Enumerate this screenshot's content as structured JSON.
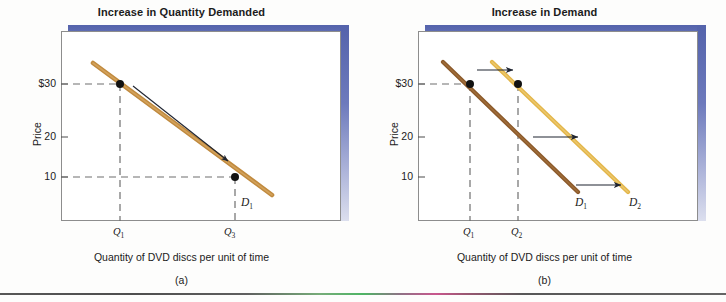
{
  "figure": {
    "panels": [
      {
        "id": "a",
        "title": "Increase in Quantity Demanded",
        "letter": "(a)",
        "x_axis_title": "Quantity of DVD discs per unit of time",
        "y_axis_title": "Price",
        "y_ticks": [
          "$30",
          "20",
          "10"
        ],
        "x_ticks": [
          "Q",
          "Q"
        ],
        "x_tick_subs": [
          "1",
          "3"
        ],
        "curves": [
          {
            "label": "D",
            "sub": "1",
            "color": "#c08a3e"
          }
        ],
        "points": [
          {
            "price": "$30",
            "quantity": "Q1"
          },
          {
            "price": "10",
            "quantity": "Q3"
          }
        ],
        "arrow_note": "movement along the demand curve from the $30 point to the 10 point"
      },
      {
        "id": "b",
        "title": "Increase in Demand",
        "letter": "(b)",
        "x_axis_title": "Quantity of DVD discs per unit of time",
        "y_axis_title": "Price",
        "y_ticks": [
          "$30",
          "20",
          "10"
        ],
        "x_ticks": [
          "Q",
          "Q"
        ],
        "x_tick_subs": [
          "1",
          "2"
        ],
        "curves": [
          {
            "label": "D",
            "sub": "1",
            "color": "#8c5a2b"
          },
          {
            "label": "D",
            "sub": "2",
            "color": "#e3b64a"
          }
        ],
        "points": [
          {
            "price": "$30",
            "quantity": "Q1"
          },
          {
            "price": "$30",
            "quantity": "Q2"
          }
        ],
        "arrow_note": "three rightward arrows showing the whole demand curve shifting right"
      }
    ],
    "colors": {
      "frame_border": "#8d8d8d",
      "band_blue": "#5463ab",
      "curve_tan": "#c08a3e",
      "curve_brown": "#8c5a2b",
      "curve_gold": "#e3b64a",
      "dashed_guide": "#6f6f6f",
      "text": "#1b1b1b"
    }
  }
}
